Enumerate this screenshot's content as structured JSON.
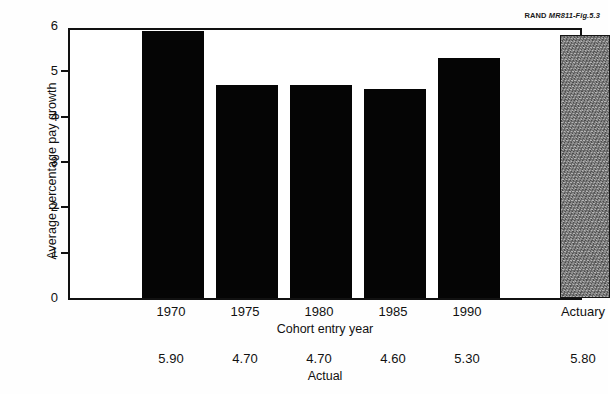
{
  "credit": {
    "org": "RAND",
    "figure_id": "MR811-Fig.5.3"
  },
  "chart_data": {
    "type": "bar",
    "title": "",
    "categories": [
      "1970",
      "1975",
      "1980",
      "1985",
      "1990",
      "Actuary"
    ],
    "values": [
      5.9,
      4.7,
      4.7,
      4.6,
      5.3,
      5.8
    ],
    "value_labels": [
      "5.90",
      "4.70",
      "4.70",
      "4.60",
      "5.30",
      "5.80"
    ],
    "bar_styles": [
      "solid",
      "solid",
      "solid",
      "solid",
      "solid",
      "hatched"
    ],
    "xlabel": "Cohort entry year",
    "ylabel": "Average percentage pay growth",
    "ylim": [
      0,
      6
    ],
    "yticks": [
      0,
      1,
      2,
      3,
      4,
      5,
      6
    ],
    "ytick_labels": [
      "0",
      "1",
      "2",
      "3",
      "4",
      "5",
      "6"
    ],
    "grid": false,
    "legend": "none",
    "value_row_label": "Actual",
    "colors": {
      "bar_solid": "#050505",
      "bar_hatched": "#8e8e8e",
      "axis": "#111111",
      "background": "#ffffff"
    }
  }
}
